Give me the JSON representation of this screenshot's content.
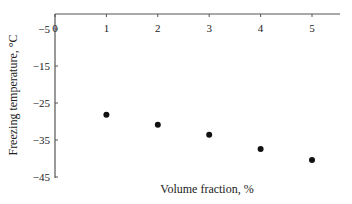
{
  "chart_data": {
    "type": "scatter",
    "title": "",
    "xlabel": "Volume fraction, %",
    "ylabel": "Freezing temperature, °C",
    "x": [
      1,
      2,
      3,
      4,
      5
    ],
    "series": [
      {
        "name": "Freezing temperature",
        "values": [
          -28.2,
          -30.9,
          -33.6,
          -37.4,
          -40.4
        ]
      }
    ],
    "xlim": [
      0,
      5.5
    ],
    "ylim": [
      -45,
      -1
    ],
    "x_ticks": [
      "0",
      "1",
      "2",
      "3",
      "4",
      "5"
    ],
    "y_ticks": [
      "-5",
      "-15",
      "-25",
      "-35",
      "-45"
    ],
    "grid": false,
    "legend": "none",
    "x_axis_position": "top",
    "marker_color": "#111111"
  }
}
